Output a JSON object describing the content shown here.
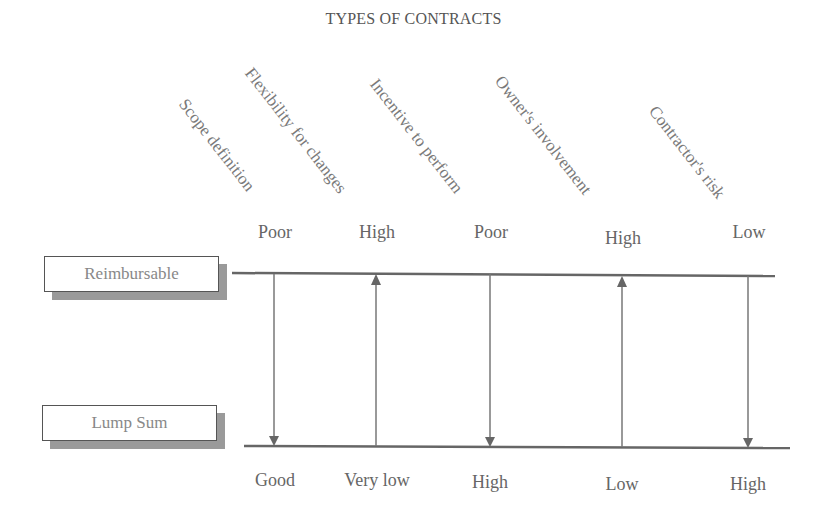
{
  "title": "TYPES OF CONTRACTS",
  "contract_types": {
    "top": "Reimbursable",
    "bottom": "Lump Sum"
  },
  "criteria": [
    {
      "label": "Scope definition",
      "reimbursable": "Poor",
      "lump_sum": "Good",
      "arrow": "down"
    },
    {
      "label": "Flexibility for changes",
      "reimbursable": "High",
      "lump_sum": "Very low",
      "arrow": "up"
    },
    {
      "label": "Incentive to perform",
      "reimbursable": "Poor",
      "lump_sum": "High",
      "arrow": "down"
    },
    {
      "label": "Owner's involvement",
      "reimbursable": "High",
      "lump_sum": "Low",
      "arrow": "up"
    },
    {
      "label": "Contractor's risk",
      "reimbursable": "Low",
      "lump_sum": "High",
      "arrow": "down"
    }
  ],
  "colors": {
    "line": "#666666",
    "shadow": "#9a9a9a",
    "text": "#777777"
  }
}
